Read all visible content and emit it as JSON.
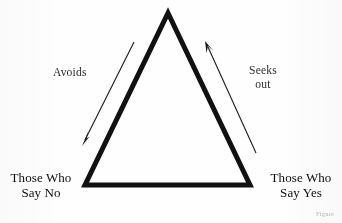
{
  "figure": {
    "type": "triangle-relationship-diagram",
    "background_color": "#fefefe",
    "stroke_color": "#111111",
    "arrow_color": "#1a1a1a",
    "triangle": {
      "apex": [
        168,
        13
      ],
      "bottom_left": [
        85,
        185
      ],
      "bottom_right": [
        250,
        185
      ],
      "stroke_width": 5
    },
    "arrows": [
      {
        "name": "avoids-arrow",
        "direction": "down-left",
        "from": [
          134,
          42
        ],
        "to": [
          82,
          144
        ]
      },
      {
        "name": "seeks-out-arrow",
        "direction": "up-left",
        "from": [
          256,
          153
        ],
        "to": [
          205,
          42
        ]
      }
    ]
  },
  "labels": {
    "avoids": "Avoids",
    "seeks_line1": "Seeks",
    "seeks_line2": "out",
    "bottom_left_line1": "Those Who",
    "bottom_left_line2": "Say No",
    "bottom_right_line1": "Those Who",
    "bottom_right_line2": "Say Yes",
    "caption_fragment": "Figure"
  }
}
